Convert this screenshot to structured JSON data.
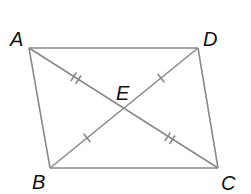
{
  "figure": {
    "type": "parallelogram-with-diagonals",
    "colors": {
      "line": "#8a8a8a",
      "label": "#111111",
      "background": "#ffffff"
    },
    "points": {
      "A": {
        "label": "A",
        "x": 29,
        "y": 48
      },
      "B": {
        "label": "B",
        "x": 50,
        "y": 168
      },
      "C": {
        "label": "C",
        "x": 218,
        "y": 168
      },
      "D": {
        "label": "D",
        "x": 198,
        "y": 48
      },
      "E": {
        "label": "E",
        "x": 124,
        "y": 108
      }
    },
    "labels": {
      "A": "A",
      "B": "B",
      "C": "C",
      "D": "D",
      "E": "E"
    },
    "sides": [
      "AD",
      "DC",
      "CB",
      "BA"
    ],
    "diagonals": [
      "AC",
      "BD"
    ],
    "tick_marks": [
      {
        "segment": "AE",
        "count": 2
      },
      {
        "segment": "EC",
        "count": 2
      },
      {
        "segment": "BE",
        "count": 1
      },
      {
        "segment": "ED",
        "count": 1
      }
    ]
  }
}
